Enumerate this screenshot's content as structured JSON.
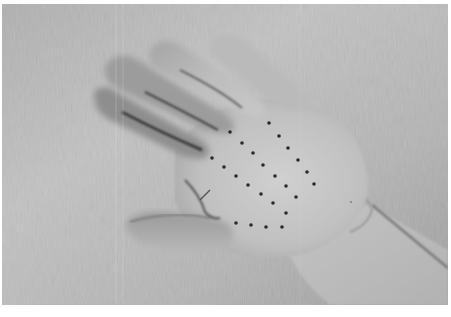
{
  "image": {
    "description": "Grayscale photograph of an open left hand, palm facing up, resting on a light textured fabric background, with a grid of small black dots marked on the palm",
    "subject": "hand-palm-with-dot-markers",
    "colors": {
      "border": "#ffffff",
      "background_fabric": "#a8a8a8",
      "background_light": "#c4c4c4",
      "skin_light": "#cfcfcf",
      "skin_mid": "#b5b5b5",
      "shadow": "#6e6e6e",
      "crease_dark": "#3a3a3a",
      "dot": "#2a2a2a"
    },
    "frame": {
      "x": 2,
      "y": 4,
      "width": 446,
      "height": 301
    }
  },
  "palm_dots": [
    {
      "x": 269,
      "y": 123
    },
    {
      "x": 230,
      "y": 132
    },
    {
      "x": 279,
      "y": 136
    },
    {
      "x": 242,
      "y": 143
    },
    {
      "x": 288,
      "y": 148
    },
    {
      "x": 253,
      "y": 153
    },
    {
      "x": 212,
      "y": 158
    },
    {
      "x": 298,
      "y": 160
    },
    {
      "x": 263,
      "y": 165
    },
    {
      "x": 224,
      "y": 167
    },
    {
      "x": 307,
      "y": 172
    },
    {
      "x": 236,
      "y": 176
    },
    {
      "x": 275,
      "y": 176
    },
    {
      "x": 314,
      "y": 184
    },
    {
      "x": 248,
      "y": 185
    },
    {
      "x": 286,
      "y": 186
    },
    {
      "x": 261,
      "y": 194
    },
    {
      "x": 296,
      "y": 197
    },
    {
      "x": 273,
      "y": 203
    },
    {
      "x": 286,
      "y": 213
    },
    {
      "x": 236,
      "y": 223
    },
    {
      "x": 251,
      "y": 225
    },
    {
      "x": 266,
      "y": 227
    },
    {
      "x": 282,
      "y": 227
    }
  ],
  "small_mark": {
    "x": 351,
    "y": 202
  }
}
